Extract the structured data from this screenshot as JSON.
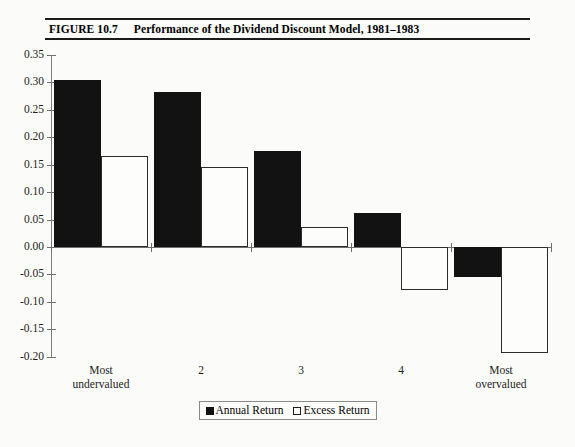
{
  "figure": {
    "number": "FIGURE 10.7",
    "title": "Performance of the Dividend Discount Model, 1981–1983"
  },
  "legend": {
    "annual": "Annual Return",
    "excess": "Excess Return"
  },
  "chart_data": {
    "type": "bar",
    "title": "Performance of the Dividend Discount Model, 1981–1983",
    "xlabel": "",
    "ylabel": "",
    "categories": [
      "Most undervalued",
      "2",
      "3",
      "4",
      "Most overvalued"
    ],
    "series": [
      {
        "name": "Annual Return",
        "values": [
          0.305,
          0.283,
          0.175,
          0.062,
          -0.055
        ]
      },
      {
        "name": "Excess Return",
        "values": [
          0.165,
          0.145,
          0.036,
          -0.078,
          -0.193
        ]
      }
    ],
    "ylim": [
      -0.2,
      0.35
    ],
    "ytick_labels": [
      "0.35",
      "0.30",
      "0.25",
      "0.20",
      "0.15",
      "0.10",
      "0.05",
      "0.00",
      "-0.05",
      "-0.10",
      "-0.15",
      "-0.20"
    ],
    "ytick_values": [
      0.35,
      0.3,
      0.25,
      0.2,
      0.15,
      0.1,
      0.05,
      0.0,
      -0.05,
      -0.1,
      -0.15,
      -0.2
    ],
    "grid": false,
    "legend_position": "bottom"
  }
}
